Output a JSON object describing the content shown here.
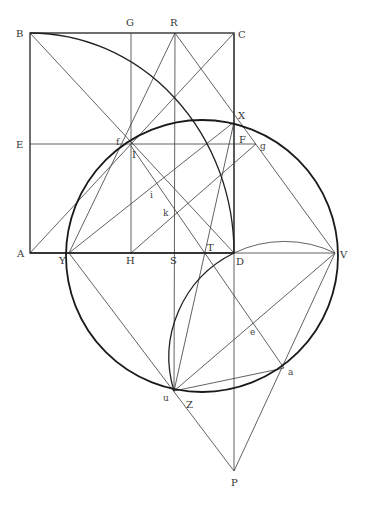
{
  "figure": {
    "type": "geometric-construction",
    "points": {
      "A": [
        30,
        253
      ],
      "B": [
        30,
        33
      ],
      "C": [
        234,
        33
      ],
      "D": [
        234,
        253
      ],
      "E": [
        30,
        144
      ],
      "F": [
        234,
        144
      ],
      "G": [
        131,
        33
      ],
      "H": [
        131,
        253
      ],
      "R": [
        175,
        33
      ],
      "S": [
        175,
        253
      ],
      "T": [
        204,
        253
      ],
      "V": [
        335,
        253
      ],
      "X": [
        234,
        122
      ],
      "Y": [
        69,
        253
      ],
      "f": [
        126,
        142
      ],
      "I": [
        131,
        146
      ],
      "g": [
        256,
        144
      ],
      "i": [
        152,
        186
      ],
      "k": [
        175,
        215
      ],
      "e": [
        254,
        325
      ],
      "a": [
        284,
        368
      ],
      "u": [
        174,
        391
      ],
      "P": [
        234,
        471
      ]
    },
    "labels": [
      {
        "text": "B",
        "x": 16,
        "y": 37
      },
      {
        "text": "G",
        "x": 126,
        "y": 26
      },
      {
        "text": "R",
        "x": 170,
        "y": 26
      },
      {
        "text": "C",
        "x": 238,
        "y": 38
      },
      {
        "text": "E",
        "x": 16,
        "y": 148
      },
      {
        "text": "f",
        "x": 116,
        "y": 145
      },
      {
        "text": "I",
        "x": 132,
        "y": 158
      },
      {
        "text": "F",
        "x": 239,
        "y": 143
      },
      {
        "text": "g",
        "x": 260,
        "y": 149
      },
      {
        "text": "X",
        "x": 238,
        "y": 119
      },
      {
        "text": "i",
        "x": 150,
        "y": 198
      },
      {
        "text": "k",
        "x": 163,
        "y": 216
      },
      {
        "text": "A",
        "x": 17,
        "y": 257
      },
      {
        "text": "Y",
        "x": 59,
        "y": 264
      },
      {
        "text": "H",
        "x": 126,
        "y": 264
      },
      {
        "text": "S",
        "x": 170,
        "y": 264
      },
      {
        "text": "T",
        "x": 207,
        "y": 251
      },
      {
        "text": "D",
        "x": 236,
        "y": 265
      },
      {
        "text": "V",
        "x": 340,
        "y": 258
      },
      {
        "text": "e",
        "x": 250,
        "y": 335
      },
      {
        "text": "a",
        "x": 288,
        "y": 375
      },
      {
        "text": "u",
        "x": 163,
        "y": 401
      },
      {
        "text": "Z",
        "x": 186,
        "y": 408
      },
      {
        "text": "P",
        "x": 231,
        "y": 486
      }
    ],
    "circles": [
      {
        "name": "main-circle",
        "cx": 202,
        "cy": 256,
        "r": 136
      },
      {
        "name": "small-circle-arc",
        "cx": 284.5,
        "cy": 357,
        "r": 116
      }
    ],
    "quarter_arc": {
      "center": "A",
      "radius": 204
    }
  }
}
